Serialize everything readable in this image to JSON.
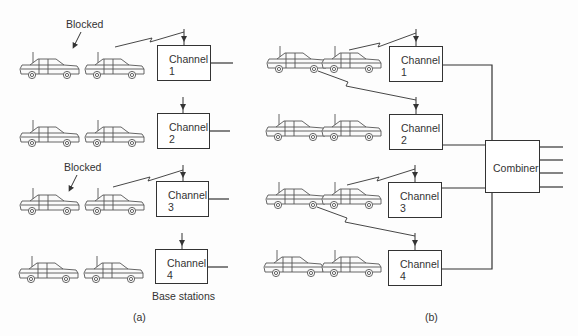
{
  "figure": {
    "panel_a": {
      "caption": "(a)",
      "blocked_labels": [
        "Blocked",
        "Blocked"
      ],
      "base_stations_label": "Base stations",
      "channels": [
        {
          "label": "Channel",
          "number": "1"
        },
        {
          "label": "Channel",
          "number": "2"
        },
        {
          "label": "Channel",
          "number": "3"
        },
        {
          "label": "Channel",
          "number": "4"
        }
      ]
    },
    "panel_b": {
      "caption": "(b)",
      "combiner_label": "Combiner",
      "channels": [
        {
          "label": "Channel",
          "number": "1"
        },
        {
          "label": "Channel",
          "number": "2"
        },
        {
          "label": "Channel",
          "number": "3"
        },
        {
          "label": "Channel",
          "number": "4"
        }
      ]
    }
  },
  "colors": {
    "line": "#333333",
    "car": "#555555",
    "background": "#fdfdfd"
  }
}
